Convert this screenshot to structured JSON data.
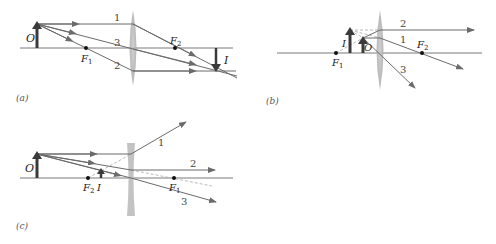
{
  "colors": {
    "ray": "#6b6b6b",
    "axis": "#7a7a7a",
    "arrow_object": "#3a3a3a",
    "lens": "#b8b8b8",
    "dashed": "#a8a8a8",
    "focal_point": "#111111"
  },
  "panels": [
    {
      "id": "a",
      "caption": "(a)",
      "lens_type": "converging",
      "labels": {
        "object": "O",
        "image": "I",
        "focal1": "F",
        "focal1_sub": "1",
        "focal2": "F",
        "focal2_sub": "2"
      },
      "rays": [
        "1",
        "2",
        "3"
      ]
    },
    {
      "id": "b",
      "caption": "(b)",
      "lens_type": "converging",
      "labels": {
        "object": "O",
        "image": "I",
        "focal1": "F",
        "focal1_sub": "1",
        "focal2": "F",
        "focal2_sub": "2"
      },
      "rays": [
        "2",
        "1",
        "3"
      ]
    },
    {
      "id": "c",
      "caption": "(c)",
      "lens_type": "diverging",
      "labels": {
        "object": "O",
        "image": "I",
        "focal1": "F",
        "focal1_sub": "1",
        "focal2": "F",
        "focal2_sub": "2"
      },
      "rays": [
        "1",
        "2",
        "3"
      ]
    }
  ]
}
